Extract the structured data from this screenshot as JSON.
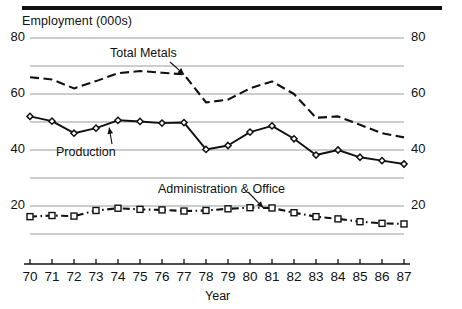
{
  "chart_data": {
    "type": "line",
    "title": "",
    "ylabel": "Employment (000s)",
    "xlabel": "Year",
    "x": [
      70,
      71,
      72,
      73,
      74,
      75,
      76,
      77,
      78,
      79,
      80,
      81,
      82,
      83,
      84,
      85,
      86,
      87
    ],
    "xtick_labels": [
      "70",
      "71",
      "72",
      "73",
      "74",
      "75",
      "76",
      "77",
      "78",
      "79",
      "80",
      "81",
      "82",
      "83",
      "84",
      "85",
      "86",
      "87"
    ],
    "ylim": [
      10,
      80
    ],
    "xlim": [
      70,
      87
    ],
    "ytick_labels_left": [
      "80",
      "60",
      "40",
      "20"
    ],
    "ytick_labels_right": [
      "80",
      "60",
      "40",
      "20"
    ],
    "gridlines": [
      80,
      70,
      60,
      50,
      40,
      30,
      20,
      10
    ],
    "grid": true,
    "legend_position": "inline-annotations",
    "series": [
      {
        "name": "Total Metals",
        "style": "dashed",
        "marker": "none",
        "color": "#111111",
        "values": [
          66.0,
          65.2,
          62.0,
          64.6,
          67.4,
          68.2,
          67.6,
          67.0,
          57.0,
          58.0,
          62.0,
          64.5,
          60.0,
          51.5,
          52.0,
          49.0,
          46.0,
          44.5
        ]
      },
      {
        "name": "Production",
        "style": "solid",
        "marker": "diamond",
        "color": "#111111",
        "values": [
          52.0,
          50.3,
          46.0,
          47.8,
          50.6,
          50.2,
          49.6,
          49.8,
          40.2,
          41.6,
          46.4,
          48.6,
          44.0,
          38.2,
          40.0,
          37.4,
          36.2,
          35.0
        ]
      },
      {
        "name": "Administration & Office",
        "style": "dash-dot",
        "marker": "square",
        "color": "#111111",
        "values": [
          16.2,
          16.6,
          16.4,
          18.4,
          19.2,
          18.8,
          18.6,
          18.2,
          18.4,
          19.0,
          19.4,
          19.3,
          17.6,
          16.2,
          15.4,
          14.4,
          13.8,
          13.6
        ]
      }
    ],
    "annotations": [
      {
        "text": "Total Metals",
        "target_x": 77,
        "target_y": 67.0
      },
      {
        "text": "Production",
        "target_x": 73.6,
        "target_y": 48.0
      },
      {
        "text": "Administration & Office",
        "target_x": 80.6,
        "target_y": 19.4
      }
    ]
  }
}
